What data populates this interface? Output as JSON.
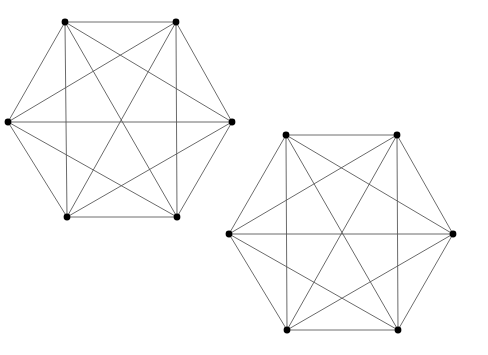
{
  "figure": {
    "canvas": {
      "width": 488,
      "height": 355
    },
    "background_color": "#ffffff"
  },
  "style": {
    "edge_color": "#5a5a5a",
    "edge_width": 0.9,
    "outline_edge_color": "#6e6e6e",
    "outline_edge_width": 1.0,
    "vertex_color": "#000000",
    "vertex_radius": 3.4
  },
  "graphs": [
    {
      "name": "graph-left",
      "label": "K6 (left)",
      "vertex_count": 6,
      "edge_count": 15,
      "vertices": [
        {
          "id": "A",
          "label": "A",
          "x": 65,
          "y": 22
        },
        {
          "id": "B",
          "label": "B",
          "x": 176,
          "y": 22
        },
        {
          "id": "C",
          "label": "C",
          "x": 232,
          "y": 122
        },
        {
          "id": "D",
          "label": "D",
          "x": 177,
          "y": 217
        },
        {
          "id": "E",
          "label": "E",
          "x": 67,
          "y": 217
        },
        {
          "id": "F",
          "label": "F",
          "x": 8,
          "y": 122
        }
      ],
      "edges": [
        {
          "from": "A",
          "to": "B",
          "kind": "outline"
        },
        {
          "from": "B",
          "to": "C",
          "kind": "outline"
        },
        {
          "from": "C",
          "to": "D",
          "kind": "outline"
        },
        {
          "from": "D",
          "to": "E",
          "kind": "outline"
        },
        {
          "from": "E",
          "to": "F",
          "kind": "outline"
        },
        {
          "from": "F",
          "to": "A",
          "kind": "outline"
        },
        {
          "from": "A",
          "to": "C",
          "kind": "short-diagonal"
        },
        {
          "from": "B",
          "to": "D",
          "kind": "short-diagonal"
        },
        {
          "from": "C",
          "to": "E",
          "kind": "short-diagonal"
        },
        {
          "from": "D",
          "to": "F",
          "kind": "short-diagonal"
        },
        {
          "from": "E",
          "to": "A",
          "kind": "short-diagonal"
        },
        {
          "from": "F",
          "to": "B",
          "kind": "short-diagonal"
        },
        {
          "from": "A",
          "to": "D",
          "kind": "long-diagonal"
        },
        {
          "from": "B",
          "to": "E",
          "kind": "long-diagonal"
        },
        {
          "from": "C",
          "to": "F",
          "kind": "long-diagonal"
        }
      ]
    },
    {
      "name": "graph-right",
      "label": "K6 (right)",
      "vertex_count": 6,
      "edge_count": 15,
      "vertices": [
        {
          "id": "A",
          "label": "A",
          "x": 286,
          "y": 135
        },
        {
          "id": "B",
          "label": "B",
          "x": 397,
          "y": 135
        },
        {
          "id": "C",
          "label": "C",
          "x": 453,
          "y": 234
        },
        {
          "id": "D",
          "label": "D",
          "x": 398,
          "y": 330
        },
        {
          "id": "E",
          "label": "E",
          "x": 287,
          "y": 330
        },
        {
          "id": "F",
          "label": "F",
          "x": 229,
          "y": 234
        }
      ],
      "edges": [
        {
          "from": "A",
          "to": "B",
          "kind": "outline"
        },
        {
          "from": "B",
          "to": "C",
          "kind": "outline"
        },
        {
          "from": "C",
          "to": "D",
          "kind": "outline"
        },
        {
          "from": "D",
          "to": "E",
          "kind": "outline"
        },
        {
          "from": "E",
          "to": "F",
          "kind": "outline"
        },
        {
          "from": "F",
          "to": "A",
          "kind": "outline"
        },
        {
          "from": "A",
          "to": "C",
          "kind": "short-diagonal"
        },
        {
          "from": "B",
          "to": "D",
          "kind": "short-diagonal"
        },
        {
          "from": "C",
          "to": "E",
          "kind": "short-diagonal"
        },
        {
          "from": "D",
          "to": "F",
          "kind": "short-diagonal"
        },
        {
          "from": "E",
          "to": "A",
          "kind": "short-diagonal"
        },
        {
          "from": "F",
          "to": "B",
          "kind": "short-diagonal"
        },
        {
          "from": "A",
          "to": "D",
          "kind": "long-diagonal"
        },
        {
          "from": "B",
          "to": "E",
          "kind": "long-diagonal"
        },
        {
          "from": "C",
          "to": "F",
          "kind": "long-diagonal"
        }
      ]
    }
  ]
}
